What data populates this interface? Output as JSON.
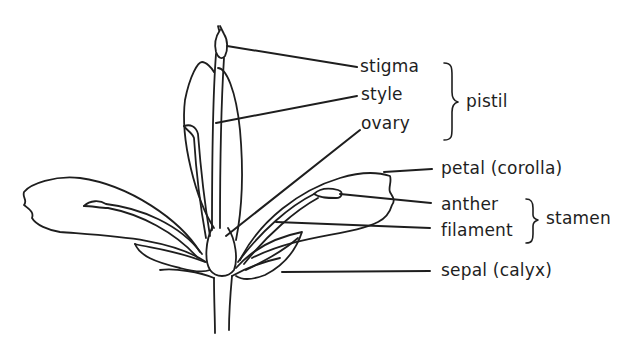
{
  "diagram": {
    "stroke_color": "#1e1e1e",
    "labels": {
      "stigma": "stigma",
      "style": "style",
      "ovary": "ovary",
      "pistil": "pistil",
      "petal": "petal (corolla)",
      "anther": "anther",
      "filament": "filament",
      "stamen": "stamen",
      "sepal": "sepal (calyx)"
    },
    "groups": [
      {
        "name": "pistil",
        "parts": [
          "stigma",
          "style",
          "ovary"
        ]
      },
      {
        "name": "stamen",
        "parts": [
          "anther",
          "filament"
        ]
      }
    ]
  }
}
